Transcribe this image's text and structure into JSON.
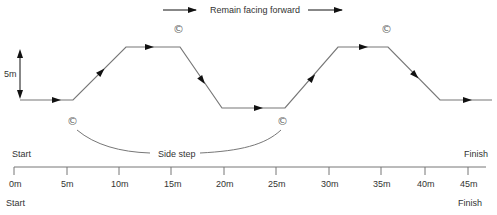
{
  "header": {
    "instruction": "Remain facing forward"
  },
  "diagram": {
    "height_marker_label": "5m",
    "side_step_label": "Side step",
    "cone_symbol": "©",
    "start_label_top": "Start",
    "finish_label_top": "Finish",
    "start_label_bottom": "Start",
    "finish_label_bottom": "Finish",
    "path_color": "#777777",
    "arrow_color": "#111111"
  },
  "axis": {
    "ticks": [
      "0m",
      "5m",
      "10m",
      "15m",
      "20m",
      "25m",
      "30m",
      "35m",
      "40m",
      "45m"
    ]
  }
}
